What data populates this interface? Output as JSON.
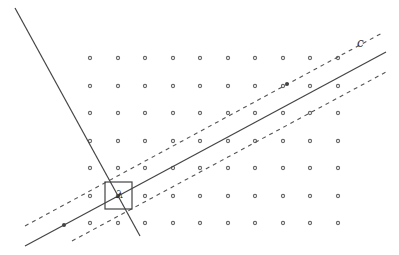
{
  "diagram": {
    "type": "lattice with lines",
    "colors": {
      "ink": "#444444",
      "dot": "#666666",
      "background": "#ffffff"
    },
    "grid": {
      "xs": [
        90,
        118,
        145,
        173,
        200,
        228,
        255,
        283,
        310,
        338
      ],
      "ys": [
        58,
        86,
        113,
        141,
        168,
        196,
        223
      ],
      "dot_radius": 1.6
    },
    "lines": {
      "main_line": {
        "x1": 25,
        "y1": 246,
        "x2": 386,
        "y2": 52,
        "style": "solid"
      },
      "upper_dashed": {
        "x1": 25,
        "y1": 226,
        "x2": 384,
        "y2": 32,
        "style": "dashed"
      },
      "lower_dashed": {
        "x1": 72,
        "y1": 241,
        "x2": 386,
        "y2": 72,
        "style": "dashed"
      },
      "steep_line": {
        "x1": 15,
        "y1": 8,
        "x2": 140,
        "y2": 236,
        "style": "solid"
      }
    },
    "box": {
      "x": 105,
      "y": 182,
      "w": 27,
      "h": 27
    },
    "labels": [
      {
        "id": "c",
        "text": "c",
        "x": 357,
        "y": 46
      },
      {
        "id": "lambda",
        "text": "λ",
        "x": 116,
        "y": 196
      }
    ],
    "markers": [
      {
        "id": "left-dot",
        "x": 64,
        "y": 225
      },
      {
        "id": "upper-marker",
        "x": 287,
        "y": 84
      }
    ]
  }
}
